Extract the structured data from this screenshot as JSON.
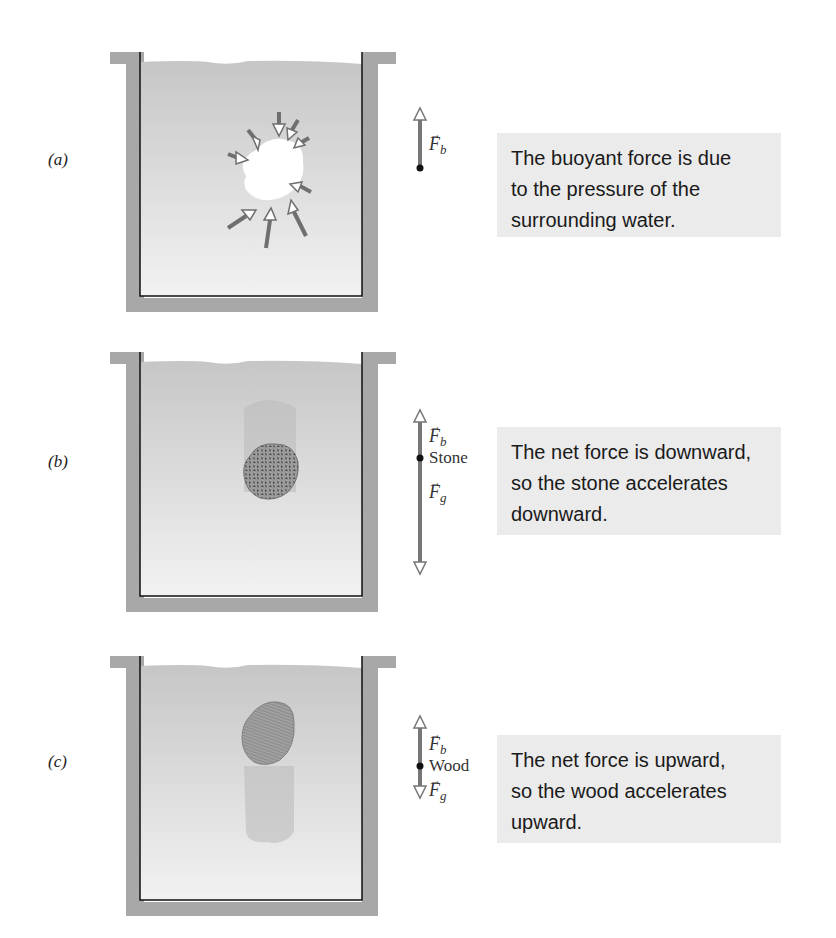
{
  "figure": {
    "panels": [
      {
        "id": "a",
        "label": "(a)",
        "object": "empty cavity (water parcel)",
        "force_labels": [
          "F_b"
        ],
        "force_symbol_b": "F",
        "force_sub_b": "b",
        "caption": "The buoyant force is due to the pressure of the surrounding water.",
        "caption_lines": [
          "The buoyant force is due",
          "to the pressure of the",
          "surrounding water."
        ]
      },
      {
        "id": "b",
        "label": "(b)",
        "object_name": "Stone",
        "force_symbol_b": "F",
        "force_sub_b": "b",
        "force_symbol_g": "F",
        "force_sub_g": "g",
        "caption": "The net force is downward, so the stone accelerates downward.",
        "caption_lines": [
          "The net force is downward,",
          "so the stone accelerates",
          "downward."
        ]
      },
      {
        "id": "c",
        "label": "(c)",
        "object_name": "Wood",
        "force_symbol_b": "F",
        "force_sub_b": "b",
        "force_symbol_g": "F",
        "force_sub_g": "g",
        "caption": "The net force is upward, so the wood accelerates upward.",
        "caption_lines": [
          "The net force is upward,",
          "so the wood accelerates",
          "upward."
        ]
      }
    ],
    "vector_arrow": "→",
    "colors": {
      "tank_wall": "#a8a8a8",
      "water_top": "#c9c9c9",
      "water_bottom": "#f0f0f0",
      "arrow": "#7a7a7a",
      "caption_bg": "#ebebeb",
      "stone": "#8a8a8a",
      "wood": "#9a9a9a"
    }
  }
}
